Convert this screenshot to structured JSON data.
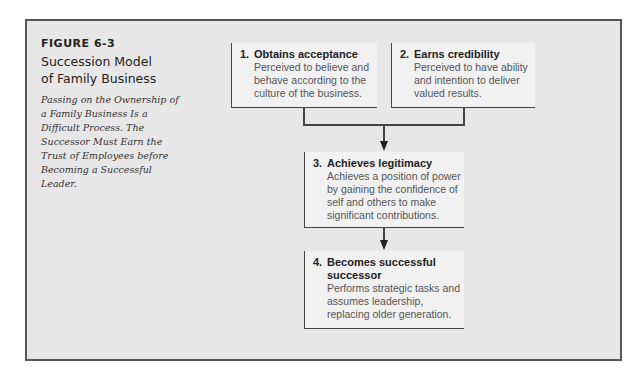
{
  "figure": {
    "number": "FIGURE 6-3",
    "title_line1": "Succession Model",
    "title_line2": "of Family Business",
    "description": "Passing on the Ownership of a Family Business Is a Difficult Process. The Successor Must Earn the Trust of Employees before Becoming a Successful Leader."
  },
  "steps": [
    {
      "num": "1.",
      "title": "Obtains acceptance",
      "desc": "Perceived to believe and behave according to the culture of the business."
    },
    {
      "num": "2.",
      "title": "Earns credibility",
      "desc": "Perceived to have ability and intention to deliver valued results."
    },
    {
      "num": "3.",
      "title": "Achieves legitimacy",
      "desc": "Achieves a position of power by gaining the confidence of self and others to make significant contributions."
    },
    {
      "num": "4.",
      "title": "Becomes successful successor",
      "desc": "Performs strategic tasks and assumes leadership, replacing older generation."
    }
  ],
  "colors": {
    "frame_bg": "#e7e7e7",
    "box_bg": "#f1f1f1",
    "line": "#444444"
  }
}
